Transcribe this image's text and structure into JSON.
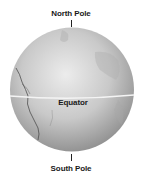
{
  "diagram": {
    "labels": {
      "north": "North Pole",
      "equator": "Equator",
      "south": "South Pole"
    },
    "colors": {
      "globe_light": "#e6e6e6",
      "globe_mid": "#bdbdbd",
      "globe_dark": "#8f8f8f",
      "equator_line": "#f4f4f4",
      "coastline": "#4a4a4a",
      "text": "#1a1a1a"
    }
  }
}
